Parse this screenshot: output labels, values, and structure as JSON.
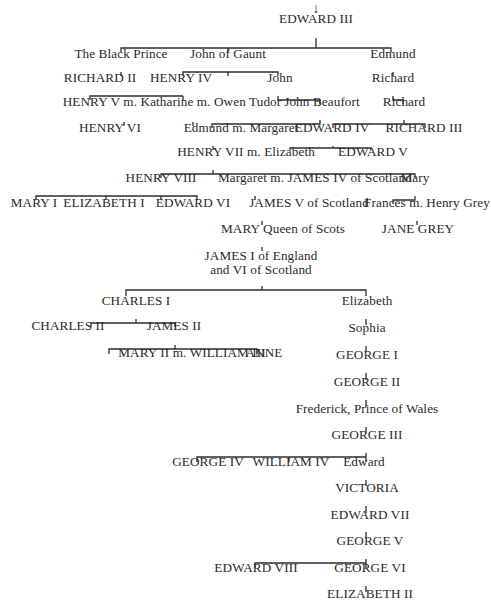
{
  "diagram": {
    "type": "family-tree",
    "root_arrow": "↓",
    "nodes": [
      {
        "id": "edward3",
        "label": "EDWARD III",
        "x": 316,
        "y": 19
      },
      {
        "id": "blackprince",
        "label": "The Black Prince",
        "x": 121,
        "y": 54
      },
      {
        "id": "gaunt",
        "label": "John of Gaunt",
        "x": 228,
        "y": 54
      },
      {
        "id": "edmund",
        "label": "Edmund",
        "x": 393,
        "y": 54
      },
      {
        "id": "richard2",
        "label": "RICHARD II",
        "x": 100,
        "y": 78
      },
      {
        "id": "henry4",
        "label": "HENRY IV",
        "x": 181,
        "y": 78
      },
      {
        "id": "john",
        "label": "John",
        "x": 280,
        "y": 78
      },
      {
        "id": "richard_a",
        "label": "Richard",
        "x": 393,
        "y": 78
      },
      {
        "id": "henry5",
        "label": "HENRY V m. Katharine m. Owen Tudor",
        "x": 172,
        "y": 102
      },
      {
        "id": "beaufort",
        "label": "John Beaufort",
        "x": 322,
        "y": 102
      },
      {
        "id": "richard_b",
        "label": "Richard",
        "x": 404,
        "y": 102
      },
      {
        "id": "henry6",
        "label": "HENRY VI",
        "x": 110,
        "y": 128
      },
      {
        "id": "edmund_m",
        "label": "Edmund m. Margaret",
        "x": 241,
        "y": 128
      },
      {
        "id": "edward4",
        "label": "EDWARD IV",
        "x": 332,
        "y": 128
      },
      {
        "id": "richard3",
        "label": "RICHARD III",
        "x": 424,
        "y": 128
      },
      {
        "id": "henry7",
        "label": "HENRY VII m. Elizabeth",
        "x": 246,
        "y": 152
      },
      {
        "id": "edward5",
        "label": "EDWARD V",
        "x": 373,
        "y": 152
      },
      {
        "id": "henry8",
        "label": "HENRY VIII",
        "x": 161,
        "y": 178
      },
      {
        "id": "margaret",
        "label": "Margaret m. JAMES IV of Scotland",
        "x": 315,
        "y": 178
      },
      {
        "id": "mary",
        "label": "Mary",
        "x": 415,
        "y": 178
      },
      {
        "id": "mary1",
        "label": "MARY I",
        "x": 34,
        "y": 203
      },
      {
        "id": "elizabeth1",
        "label": "ELIZABETH I",
        "x": 104,
        "y": 203
      },
      {
        "id": "edward6",
        "label": "EDWARD VI",
        "x": 193,
        "y": 203
      },
      {
        "id": "james5",
        "label": "JAMES V of Scotland",
        "x": 309,
        "y": 203
      },
      {
        "id": "frances",
        "label": "Frances m. Henry Grey",
        "x": 427,
        "y": 203
      },
      {
        "id": "maryqos",
        "label": "MARY Queen of Scots",
        "x": 283,
        "y": 229
      },
      {
        "id": "janegrey",
        "label": "JANE GREY",
        "x": 418,
        "y": 229
      },
      {
        "id": "james1",
        "label": "JAMES I of England\nand VI of Scotland",
        "x": 261,
        "y": 256
      },
      {
        "id": "charles1",
        "label": "CHARLES I",
        "x": 136,
        "y": 301
      },
      {
        "id": "elizabeth",
        "label": "Elizabeth",
        "x": 367,
        "y": 301
      },
      {
        "id": "charles2",
        "label": "CHARLES II",
        "x": 68,
        "y": 326
      },
      {
        "id": "james2",
        "label": "JAMES II",
        "x": 174,
        "y": 326
      },
      {
        "id": "sophia",
        "label": "Sophia",
        "x": 367,
        "y": 328
      },
      {
        "id": "mary2",
        "label": "MARY II m. WILLIAM III",
        "x": 192,
        "y": 353
      },
      {
        "id": "anne",
        "label": "ANNE",
        "x": 264,
        "y": 353
      },
      {
        "id": "george1",
        "label": "GEORGE I",
        "x": 367,
        "y": 355
      },
      {
        "id": "george2",
        "label": "GEORGE II",
        "x": 367,
        "y": 382
      },
      {
        "id": "frederick",
        "label": "Frederick, Prince of Wales",
        "x": 367,
        "y": 409
      },
      {
        "id": "george3",
        "label": "GEORGE III",
        "x": 367,
        "y": 435
      },
      {
        "id": "george4",
        "label": "GEORGE IV",
        "x": 208,
        "y": 462
      },
      {
        "id": "william4",
        "label": "WILLIAM IV",
        "x": 291,
        "y": 462
      },
      {
        "id": "edward",
        "label": "Edward",
        "x": 364,
        "y": 462
      },
      {
        "id": "victoria",
        "label": "VICTORIA",
        "x": 367,
        "y": 488
      },
      {
        "id": "edward7",
        "label": "EDWARD VII",
        "x": 370,
        "y": 515
      },
      {
        "id": "george5",
        "label": "GEORGE V",
        "x": 370,
        "y": 541
      },
      {
        "id": "edward8",
        "label": "EDWARD VIII",
        "x": 256,
        "y": 568
      },
      {
        "id": "george6",
        "label": "GEORGE VI",
        "x": 370,
        "y": 568
      },
      {
        "id": "elizabeth2",
        "label": "ELIZABETH II",
        "x": 370,
        "y": 594
      }
    ],
    "connectors": [
      "M316 38 V48 M121 52 V48 H391 V52",
      "M228 48 V52",
      "M121 72 V76",
      "M228 72 V76 M183 76 V72 H278 V76",
      "M183 96 V100 M90 100 V96 H183",
      "M278 96 V100 H320 V104",
      "M393 72 V76",
      "M393 96 V100 H403 V104",
      "M124 122 V126",
      "M193 122 V126",
      "M320 120 V124 H212 V128",
      "M404 120 V124 H333 V128 M404 124 H425 V128",
      "M213 146 V150",
      "M333 146 V148 H290 V150 M333 148 H371 V150",
      "M213 170 V174 H161 V178 M213 174 H415 V178",
      "M161 196 V200 M36 200 V196 H197 V200 M106 196 V200",
      "M255 196 V200",
      "M415 196 V200 H393 V204",
      "M262 221 V225",
      "M417 221 V225",
      "M262 247 V251",
      "M262 286 V290 H126 V296 M262 290 H366 V296",
      "M136 319 V323 H91 V327 M136 323 H175 V327",
      "M175 345 V349 H109 V354 M175 349 H257 V354",
      "M366 319 V325",
      "M366 346 V352",
      "M366 373 V380",
      "M366 400 V407",
      "M366 427 V433",
      "M366 453 V457 H197 V462 M366 457 H289 V462 M366 457 V462",
      "M366 480 V486",
      "M366 506 V513",
      "M366 532 V539",
      "M366 559 V563 H255 V568 M366 563 V568",
      "M366 586 V592"
    ]
  }
}
